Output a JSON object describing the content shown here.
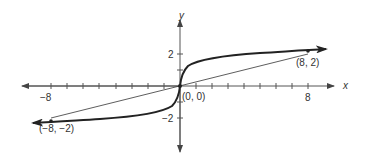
{
  "graph": {
    "function": "y = cube root of x",
    "axes": {
      "x_label": "x",
      "y_label": "y",
      "x_ticks": [
        -8,
        -7,
        -6,
        -5,
        -4,
        -3,
        -2,
        -1,
        1,
        2,
        3,
        4,
        5,
        6,
        7,
        8
      ],
      "x_tick_labels": {
        "neg": "−8",
        "pos": "8"
      },
      "y_ticks": [
        -2,
        -1,
        1,
        2
      ],
      "y_tick_labels": {
        "pos": "2",
        "neg": "−2"
      }
    },
    "points": [
      {
        "label": "(−8, −2)",
        "x": -8,
        "y": -2
      },
      {
        "label": "(0, 0)",
        "x": 0,
        "y": 0
      },
      {
        "label": "(8, 2)",
        "x": 8,
        "y": 2
      }
    ],
    "secant_line": {
      "from": [
        -8,
        -2
      ],
      "to": [
        8,
        2
      ]
    },
    "colors": {
      "curve": "#2a2a2a",
      "axis": "#555555",
      "text": "#333333"
    }
  }
}
